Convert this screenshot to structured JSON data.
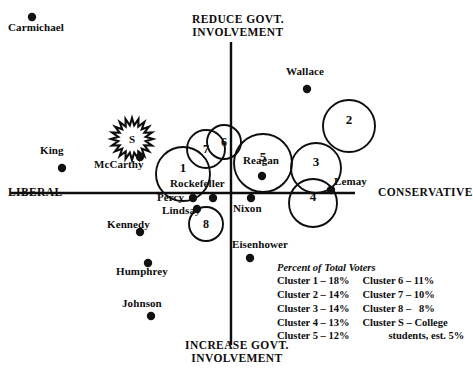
{
  "chart_data": {
    "type": "scatter",
    "title": "",
    "xlabel": "LIBERAL — CONSERVATIVE",
    "ylabel": "INCREASE GOVT. INVOLVEMENT — REDUCE GOVT. INVOLVEMENT",
    "axis_labels": {
      "left": "LIBERAL",
      "right": "CONSERVATIVE",
      "top_line1": "REDUCE GOVT.",
      "top_line2": "INVOLVEMENT",
      "bottom_line1": "INCREASE GOVT.",
      "bottom_line2": "INVOLVEMENT"
    },
    "xlim": [
      -1,
      1
    ],
    "ylim": [
      -1,
      1
    ],
    "grid": false,
    "legend_position": "lower-right",
    "origin_px": [
      231,
      193
    ],
    "points": [
      {
        "label": "Carmichael",
        "x_px": 32,
        "y_px": 17,
        "label_x_px": 8,
        "label_y_px": 22
      },
      {
        "label": "King",
        "x_px": 62,
        "y_px": 168,
        "label_x_px": 40,
        "label_y_px": 145
      },
      {
        "label": "McCarthy",
        "x_px": 140,
        "y_px": 157,
        "label_x_px": 94,
        "label_y_px": 159
      },
      {
        "label": "Wallace",
        "x_px": 307,
        "y_px": 89,
        "label_x_px": 286,
        "label_y_px": 66
      },
      {
        "label": "Reagan",
        "x_px": 262,
        "y_px": 176,
        "label_x_px": 243,
        "label_y_px": 155
      },
      {
        "label": "Lemay",
        "x_px": 331,
        "y_px": 190,
        "label_x_px": 334,
        "label_y_px": 176
      },
      {
        "label": "Rockefeller",
        "x_px": 213,
        "y_px": 198,
        "label_x_px": 170,
        "label_y_px": 178
      },
      {
        "label": "Percy",
        "x_px": 193,
        "y_px": 198,
        "label_x_px": 157,
        "label_y_px": 192
      },
      {
        "label": "Lindsay",
        "x_px": 197,
        "y_px": 209,
        "label_x_px": 162,
        "label_y_px": 205
      },
      {
        "label": "Nixon",
        "x_px": 251,
        "y_px": 198,
        "label_x_px": 233,
        "label_y_px": 203
      },
      {
        "label": "Kennedy",
        "x_px": 140,
        "y_px": 232,
        "label_x_px": 107,
        "label_y_px": 219
      },
      {
        "label": "Humphrey",
        "x_px": 148,
        "y_px": 263,
        "label_x_px": 116,
        "label_y_px": 266
      },
      {
        "label": "Johnson",
        "x_px": 151,
        "y_px": 316,
        "label_x_px": 122,
        "label_y_px": 298
      },
      {
        "label": "Eisenhower",
        "x_px": 250,
        "y_px": 258,
        "label_x_px": 232,
        "label_y_px": 239
      }
    ],
    "clusters": [
      {
        "name": "1",
        "cx_px": 183,
        "cy_px": 174,
        "r_px": 27
      },
      {
        "name": "2",
        "cx_px": 349,
        "cy_px": 126,
        "r_px": 26
      },
      {
        "name": "3",
        "cx_px": 316,
        "cy_px": 168,
        "r_px": 25
      },
      {
        "name": "4",
        "cx_px": 313,
        "cy_px": 203,
        "r_px": 24
      },
      {
        "name": "5",
        "cx_px": 263,
        "cy_px": 163,
        "r_px": 29
      },
      {
        "name": "6",
        "cx_px": 224,
        "cy_px": 142,
        "r_px": 17
      },
      {
        "name": "7",
        "cx_px": 206,
        "cy_px": 149,
        "r_px": 19
      },
      {
        "name": "8",
        "cx_px": 206,
        "cy_px": 224,
        "r_px": 17
      },
      {
        "name": "S",
        "cx_px": 132,
        "cy_px": 139,
        "r_px": 21,
        "shape": "starburst"
      }
    ]
  },
  "legend": {
    "title": "Percent of Total Voters",
    "column_left": [
      "Cluster 1 – 18%",
      "Cluster 2 – 14%",
      "Cluster 3 – 14%",
      "Cluster 4 – 13%",
      "Cluster 5 – 12%"
    ],
    "column_right": [
      "Cluster 6 – 11%",
      "Cluster 7 – 10%",
      "Cluster 8 –   8%",
      "Cluster S – College",
      "students, est. 5%"
    ]
  },
  "colors": {
    "ink": "#0d0d0d",
    "background": "#ffffff",
    "dot": "#111111"
  }
}
